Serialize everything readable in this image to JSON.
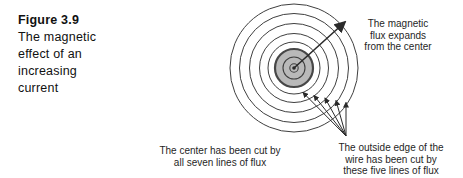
{
  "figure": {
    "label": "Figure 3.9",
    "caption_lines": [
      "The magnetic",
      "effect of an",
      "increasing",
      "current"
    ]
  },
  "annotations": {
    "flux_expands": {
      "lines": [
        "The magnetic",
        "flux expands",
        "from the center"
      ]
    },
    "center_cut": {
      "lines": [
        "The center has been cut by",
        "all seven lines of flux"
      ]
    },
    "outside_edge": {
      "lines": [
        "The outside edge of the",
        "wire has been cut by",
        "these five lines of flux"
      ]
    }
  },
  "diagram": {
    "total_flux_lines": 7,
    "flux_lines_cutting_wire_edge": 5,
    "flux_lines_inside_wire": 2,
    "center": {
      "x": 294,
      "y": 68
    },
    "wire": {
      "radius": 19,
      "fill": "#b9b9b9",
      "stroke": "#474747",
      "stroke_width": 2.2
    },
    "center_dot_radius": 1.8,
    "inner_radii": [
      4.2,
      11
    ],
    "outer_radii": [
      26,
      34.5,
      44.5,
      54.5,
      64
    ],
    "line_color": "#3f3f3f",
    "arrow_color": "#2a2a2a",
    "expand_arrow": {
      "x1": 294,
      "y1": 68,
      "x2": 345,
      "y2": 22
    },
    "fan_origin": {
      "x": 346,
      "y": 136
    },
    "fan_heads": [
      [
        303,
        92.5
      ],
      [
        314,
        95.5
      ],
      [
        325,
        98
      ],
      [
        336,
        100.5
      ],
      [
        346,
        102.5
      ]
    ]
  }
}
